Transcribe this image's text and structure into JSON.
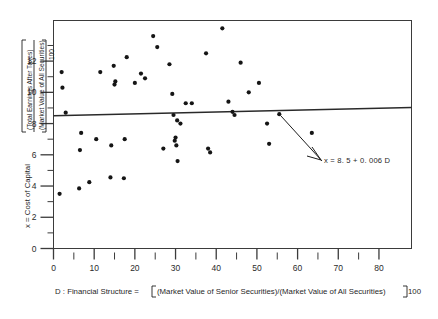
{
  "chart_data": {
    "type": "scatter",
    "title": "",
    "xlabel": "D : Financial Structure = [(Market Value of Senior Securities)/(Market Value of All Securities)]100",
    "ylabel": "x = Cost of Capital [(Total Earnings After Taxes)/(Market Value of All Securities)]100",
    "xlim": [
      0,
      88
    ],
    "ylim": [
      0,
      14.6
    ],
    "grid": false,
    "legend": null,
    "xticks": [
      0,
      10,
      20,
      30,
      40,
      50,
      60,
      70,
      80
    ],
    "xtick_labels": [
      "0",
      "10",
      "20",
      "30",
      "40",
      "50",
      "60",
      "70",
      "80"
    ],
    "xminor_ticks": [
      5,
      15,
      25,
      35,
      45,
      55,
      65,
      75
    ],
    "yticks": [
      0,
      2,
      4,
      6,
      8,
      10,
      12
    ],
    "ytick_labels": [
      "0",
      "2",
      "4",
      "6",
      "8",
      "10",
      "12"
    ],
    "yminor_ticks": [
      1,
      3,
      5,
      7,
      9,
      11,
      13
    ],
    "annotation": "x = 8. 5 + 0. 006 D",
    "fit_line": {
      "intercept": 8.5,
      "slope": 0.006,
      "x_start": 0,
      "x_end": 88
    },
    "points": [
      {
        "x": 1.5,
        "y": 3.5
      },
      {
        "x": 2.0,
        "y": 11.3
      },
      {
        "x": 2.2,
        "y": 10.3
      },
      {
        "x": 3.0,
        "y": 8.7
      },
      {
        "x": 6.3,
        "y": 3.85
      },
      {
        "x": 6.5,
        "y": 6.3
      },
      {
        "x": 6.8,
        "y": 7.4
      },
      {
        "x": 8.8,
        "y": 4.25
      },
      {
        "x": 10.5,
        "y": 7.0
      },
      {
        "x": 11.5,
        "y": 11.3
      },
      {
        "x": 14.0,
        "y": 4.55
      },
      {
        "x": 14.2,
        "y": 6.6
      },
      {
        "x": 14.8,
        "y": 11.7
      },
      {
        "x": 15.0,
        "y": 10.5
      },
      {
        "x": 15.2,
        "y": 10.7
      },
      {
        "x": 17.3,
        "y": 4.5
      },
      {
        "x": 17.5,
        "y": 7.0
      },
      {
        "x": 18.0,
        "y": 12.25
      },
      {
        "x": 20.0,
        "y": 10.6
      },
      {
        "x": 21.5,
        "y": 11.2
      },
      {
        "x": 22.5,
        "y": 10.9
      },
      {
        "x": 24.5,
        "y": 13.6
      },
      {
        "x": 25.5,
        "y": 12.9
      },
      {
        "x": 27.0,
        "y": 6.4
      },
      {
        "x": 28.5,
        "y": 11.8
      },
      {
        "x": 29.2,
        "y": 9.9
      },
      {
        "x": 29.5,
        "y": 8.55
      },
      {
        "x": 29.8,
        "y": 6.9
      },
      {
        "x": 30.0,
        "y": 7.1
      },
      {
        "x": 30.2,
        "y": 6.6
      },
      {
        "x": 30.4,
        "y": 8.2
      },
      {
        "x": 30.5,
        "y": 5.6
      },
      {
        "x": 31.2,
        "y": 8.0
      },
      {
        "x": 32.5,
        "y": 9.3
      },
      {
        "x": 34.0,
        "y": 9.3
      },
      {
        "x": 37.5,
        "y": 12.5
      },
      {
        "x": 38.0,
        "y": 6.4
      },
      {
        "x": 38.5,
        "y": 6.15
      },
      {
        "x": 41.5,
        "y": 14.1
      },
      {
        "x": 43.0,
        "y": 9.4
      },
      {
        "x": 44.0,
        "y": 8.75
      },
      {
        "x": 44.5,
        "y": 8.55
      },
      {
        "x": 46.0,
        "y": 11.9
      },
      {
        "x": 48.0,
        "y": 10.0
      },
      {
        "x": 50.5,
        "y": 10.6
      },
      {
        "x": 52.5,
        "y": 8.0
      },
      {
        "x": 53.0,
        "y": 6.7
      },
      {
        "x": 55.5,
        "y": 8.6
      },
      {
        "x": 63.5,
        "y": 7.4
      }
    ]
  },
  "labels": {
    "y_axis_prefix": "x = Cost of Capital",
    "y_axis_numerator": "(Total Earnings After Taxes)",
    "y_axis_denominator": "(Market Value of All Securities)",
    "y_axis_suffix": "100",
    "x_axis_prefix": "D : Financial Structure =",
    "x_axis_body": "(Market Value of Senior Securities)/(Market Value of All Securities)",
    "x_axis_suffix": "100"
  },
  "colors": {
    "background": "#ffffff",
    "axis": "#3b3b3b",
    "point": "#151515",
    "line": "#2a2a2a",
    "text": "#1f1f1f"
  }
}
